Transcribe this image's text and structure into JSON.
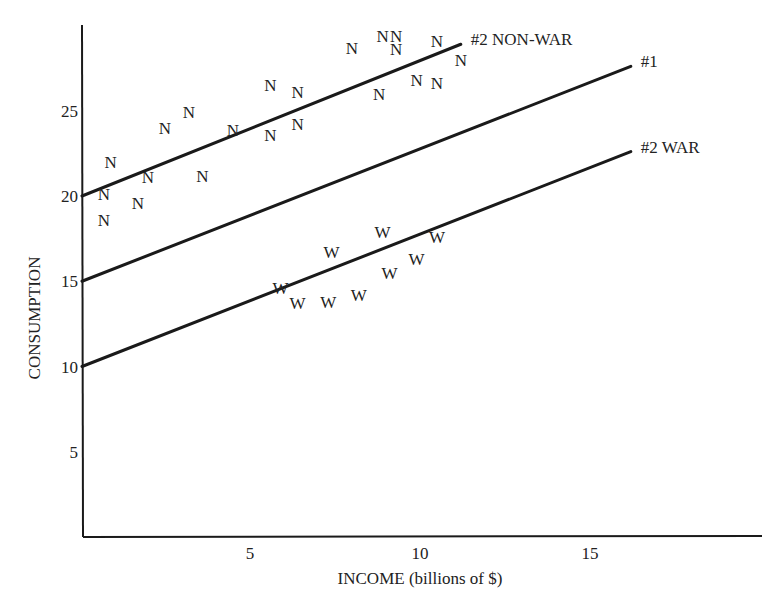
{
  "chart_data": {
    "type": "scatter",
    "title": "",
    "xlabel": "INCOME (billions of $)",
    "ylabel": "CONSUMPTION",
    "xlim": [
      0,
      20
    ],
    "ylim": [
      0,
      30
    ],
    "x_ticks": [
      5,
      10,
      15
    ],
    "y_ticks": [
      5,
      10,
      15,
      20,
      25
    ],
    "grid": false,
    "legend": "none (lines labeled directly at right end)",
    "lines": [
      {
        "name": "#2 NON-WAR",
        "label": "#2 NON-WAR",
        "x": [
          0,
          11.2
        ],
        "y": [
          20,
          28.9
        ]
      },
      {
        "name": "#1",
        "label": "#1",
        "x": [
          0,
          16.2
        ],
        "y": [
          15,
          27.6
        ]
      },
      {
        "name": "#2 WAR",
        "label": "#2 WAR",
        "x": [
          0,
          16.2
        ],
        "y": [
          10,
          22.6
        ]
      }
    ],
    "series": [
      {
        "name": "Non-war years",
        "marker": "N",
        "points": [
          [
            0.7,
            20.1
          ],
          [
            0.7,
            18.6
          ],
          [
            0.9,
            22.0
          ],
          [
            1.7,
            19.6
          ],
          [
            2.0,
            21.1
          ],
          [
            2.5,
            24.0
          ],
          [
            3.2,
            24.9
          ],
          [
            3.6,
            21.2
          ],
          [
            4.5,
            23.9
          ],
          [
            5.6,
            23.6
          ],
          [
            5.6,
            26.5
          ],
          [
            6.4,
            24.2
          ],
          [
            6.4,
            26.1
          ],
          [
            8.0,
            28.7
          ],
          [
            8.8,
            26.0
          ],
          [
            8.9,
            29.4
          ],
          [
            9.3,
            29.4
          ],
          [
            9.3,
            28.6
          ],
          [
            9.9,
            26.8
          ],
          [
            10.5,
            26.6
          ],
          [
            10.5,
            29.1
          ],
          [
            11.2,
            28.0
          ]
        ]
      },
      {
        "name": "War years",
        "marker": "W",
        "points": [
          [
            5.9,
            14.6
          ],
          [
            6.4,
            13.7
          ],
          [
            7.3,
            13.8
          ],
          [
            7.4,
            16.7
          ],
          [
            8.2,
            14.2
          ],
          [
            8.9,
            17.9
          ],
          [
            9.1,
            15.5
          ],
          [
            9.9,
            16.3
          ],
          [
            10.5,
            17.6
          ]
        ]
      }
    ]
  }
}
